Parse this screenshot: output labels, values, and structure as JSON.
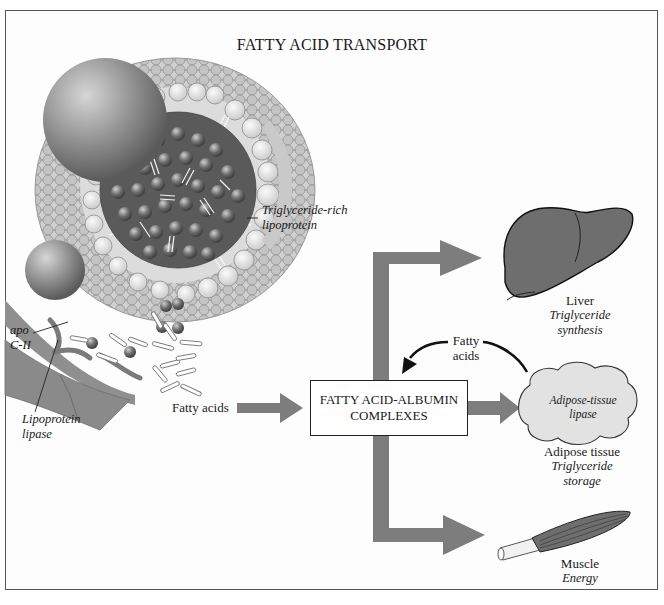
{
  "title": "FATTY ACID TRANSPORT",
  "lipoprotein": {
    "label_line1": "Triglyceride-rich",
    "label_line2": "lipoprotein"
  },
  "apo": {
    "line1": "apo",
    "line2": "C-II"
  },
  "lipase": {
    "line1": "Lipoprotein",
    "line2": "lipase"
  },
  "fatty_acids_label": "Fatty acids",
  "complex_box": {
    "line1": "FATTY ACID-ALBUMIN",
    "line2": "COMPLEXES"
  },
  "return_arrow": {
    "line1": "Fatty",
    "line2": "acids"
  },
  "liver": {
    "name": "Liver",
    "role_line1": "Triglyceride",
    "role_line2": "synthesis"
  },
  "adipose": {
    "inner_line1": "Adipose-tissue",
    "inner_line2": "lipase",
    "name": "Adipose tissue",
    "role_line1": "Triglyceride",
    "role_line2": "storage"
  },
  "muscle": {
    "name": "Muscle",
    "role": "Energy"
  },
  "colors": {
    "arrow": "#7d7d7d",
    "organ": "#6e6e6e",
    "adipose_fill": "#e2e2e2",
    "core": "#5d5d5d"
  }
}
